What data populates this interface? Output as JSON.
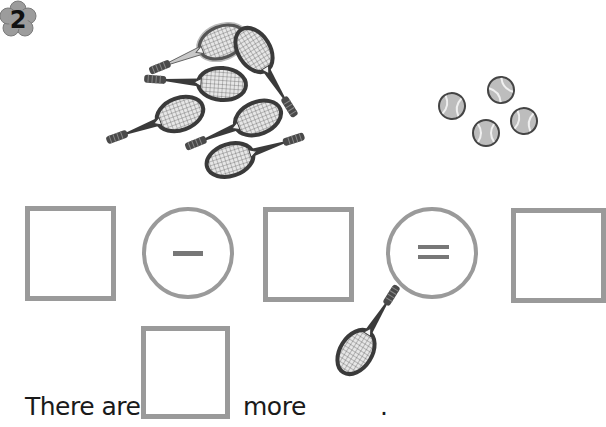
{
  "problem": {
    "number": "2",
    "badge_icon": "flower-badge-icon"
  },
  "picture": {
    "rackets": {
      "count": 6,
      "icon": "tennis-racket-icon"
    },
    "balls": {
      "count": 4,
      "icon": "tennis-ball-icon"
    }
  },
  "equation": {
    "boxes": [
      "",
      "",
      ""
    ],
    "operators": [
      {
        "symbol": "−",
        "name": "minus"
      },
      {
        "symbol": "=",
        "name": "equals"
      }
    ]
  },
  "sentence": {
    "prefix": "There are",
    "answer": "",
    "middle": "more",
    "object_icon": "tennis-racket-icon",
    "suffix": "."
  },
  "colors": {
    "box_border": "#9a9a9a",
    "operator_mark": "#777777",
    "racket_dark": "#3a3a3a",
    "racket_light": "#b8b8b8",
    "ball_fill": "#bdbdbd"
  }
}
